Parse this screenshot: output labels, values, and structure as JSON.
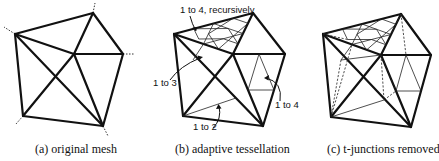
{
  "figure": {
    "panels": [
      {
        "id": "a",
        "caption": "(a) original mesh",
        "vertices": {
          "TL": [
            15,
            34
          ],
          "T": [
            93,
            13
          ],
          "R": [
            123,
            54
          ],
          "C": [
            74,
            54
          ],
          "BL": [
            23,
            116
          ],
          "BR": [
            103,
            126
          ]
        }
      },
      {
        "id": "b",
        "caption": "(b) adaptive tessellation",
        "annotations": [
          {
            "text": "1 to 4, recursively"
          },
          {
            "text": "1 to 3"
          },
          {
            "text": "1 to 4"
          },
          {
            "text": "1 to 2"
          }
        ]
      },
      {
        "id": "c",
        "caption": "(c)  t-junctions removed"
      }
    ],
    "colors": {
      "line": "#111111",
      "background": "#ffffff"
    }
  }
}
